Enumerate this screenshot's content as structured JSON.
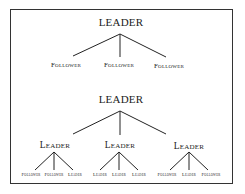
{
  "diagram": {
    "tree1": {
      "root": "LEADER",
      "children": [
        "Follower",
        "Follower",
        "Follower"
      ]
    },
    "tree2": {
      "root": "LEADER",
      "children": [
        {
          "label": "Leader",
          "children": [
            "Follower",
            "Follower",
            "Leader"
          ]
        },
        {
          "label": "Leader",
          "children": [
            "Leader",
            "Leader",
            "Leader"
          ]
        },
        {
          "label": "Leader",
          "children": [
            "Follower",
            "Leader",
            "Follower"
          ]
        }
      ]
    }
  }
}
